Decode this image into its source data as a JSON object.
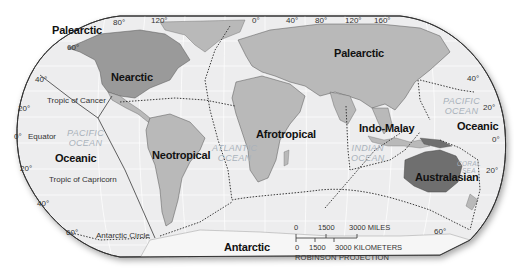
{
  "map": {
    "projection": "ROBINSON PROJECTION",
    "realms": [
      {
        "id": "palearctic-west",
        "label": "Palearctic"
      },
      {
        "id": "palearctic-east",
        "label": "Palearctic"
      },
      {
        "id": "nearctic",
        "label": "Nearctic"
      },
      {
        "id": "neotropical",
        "label": "Neotropical"
      },
      {
        "id": "afrotropical",
        "label": "Afrotropical"
      },
      {
        "id": "indo-malay",
        "label": "Indo-Malay"
      },
      {
        "id": "australasian",
        "label": "Australasian"
      },
      {
        "id": "oceanic-west",
        "label": "Oceanic"
      },
      {
        "id": "oceanic-east",
        "label": "Oceanic"
      },
      {
        "id": "antarctic",
        "label": "Antarctic"
      }
    ],
    "oceans": [
      {
        "id": "pacific-west",
        "label": "PACIFIC\nOCEAN"
      },
      {
        "id": "atlantic",
        "label": "ATLANTIC\nOCEAN"
      },
      {
        "id": "indian",
        "label": "INDIAN\nOCEAN"
      },
      {
        "id": "pacific-east",
        "label": "PACIFIC\nOCEAN"
      },
      {
        "id": "coral-sea",
        "label": "CORAL\nSEA"
      }
    ],
    "reference_lines": {
      "tropic_of_cancer": "Tropic of Cancer",
      "equator": "Equator",
      "tropic_of_capricorn": "Tropic of Capricorn",
      "antarctic_circle": "Antarctic Circle"
    },
    "latitude_labels": {
      "left": [
        "60°",
        "40°",
        "20°",
        "0°",
        "20°",
        "40°",
        "60°"
      ],
      "right": [
        "40°",
        "20°",
        "0°",
        "20°",
        "60°"
      ]
    },
    "longitude_labels": [
      "80°",
      "120°",
      "0°",
      "40°",
      "80°",
      "120°",
      "160°"
    ],
    "scale_bar": {
      "miles": [
        "0",
        "1500",
        "3000 MILES"
      ],
      "kilometers": [
        "0",
        "1500",
        "3000 KILOMETERS"
      ]
    },
    "colors": {
      "ocean": "#ededee",
      "land": "#b9b9b9",
      "nearctic": "#9a9a9a",
      "australasian": "#6f6f6f",
      "antarctica": "#f4f4f4",
      "border": "#333333",
      "realm_boundary": "#3a3a3a",
      "ocean_label": "#a9b2bb"
    }
  }
}
